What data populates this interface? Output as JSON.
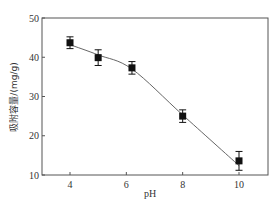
{
  "chart_data": {
    "type": "scatter",
    "title": "",
    "xlabel": "pH",
    "ylabel": "吸附容量/(mg/g)",
    "xlim": [
      3.0,
      11.0
    ],
    "ylim": [
      10,
      50
    ],
    "xticks": [
      4,
      6,
      8,
      10
    ],
    "yticks": [
      10,
      20,
      30,
      40,
      50
    ],
    "grid": false,
    "legend": null,
    "series": [
      {
        "name": "data",
        "marker": "filled-square",
        "x": [
          4,
          5,
          6.2,
          8,
          10
        ],
        "y": [
          43.7,
          39.9,
          37.3,
          25.0,
          13.6
        ],
        "error": [
          1.5,
          2.0,
          1.6,
          1.6,
          2.4
        ]
      },
      {
        "name": "fit",
        "style": "line",
        "x": [
          4,
          5,
          6.2,
          8,
          10
        ],
        "y": [
          43.2,
          40.6,
          37.0,
          25.3,
          12.4
        ]
      }
    ]
  },
  "axes": {
    "x_tick_labels": [
      "4",
      "6",
      "8",
      "10"
    ],
    "y_tick_labels": [
      "10",
      "20",
      "30",
      "40",
      "50"
    ],
    "xlabel": "pH",
    "ylabel": "吸附容量/(mg/g)"
  },
  "colors": {
    "axis": "#555555",
    "marker": "#111111",
    "line": "#666666",
    "text": "#333333"
  }
}
